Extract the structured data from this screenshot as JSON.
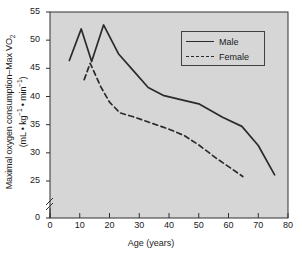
{
  "chart_data": {
    "type": "line",
    "title": "",
    "xlabel": "Age (years)",
    "ylabel_line1": "Maximal oxygen consumption–Max VO",
    "ylabel_line1_sub": "2",
    "ylabel_line2_prefix": "(mL • kg",
    "ylabel_line2_sup1": "−1",
    "ylabel_line2_mid": " • min",
    "ylabel_line2_sup2": "−1",
    "ylabel_line2_suffix": ")",
    "xlim": [
      0,
      80
    ],
    "ylim": [
      0,
      55
    ],
    "y_axis_break": true,
    "y_break_between": [
      0,
      25
    ],
    "xticks": [
      0,
      10,
      20,
      30,
      40,
      50,
      60,
      70,
      80
    ],
    "yticks": [
      0,
      25,
      30,
      35,
      40,
      45,
      50,
      55
    ],
    "grid": false,
    "plot_background": "#d6d6d6",
    "axis_color": "#303030",
    "line_color": "#2b2b2b",
    "legend_position": "upper right",
    "legend": [
      "Male",
      "Female"
    ],
    "series": [
      {
        "name": "Male",
        "style": "solid",
        "points": [
          [
            6.5,
            46.4
          ],
          [
            10.5,
            52.0
          ],
          [
            14.0,
            46.2
          ],
          [
            18.0,
            52.7
          ],
          [
            23.0,
            47.6
          ],
          [
            28.0,
            44.6
          ],
          [
            33.0,
            41.6
          ],
          [
            38.0,
            40.2
          ],
          [
            45.0,
            39.3
          ],
          [
            50.0,
            38.7
          ],
          [
            58.0,
            36.3
          ],
          [
            64.5,
            34.7
          ],
          [
            70.0,
            31.3
          ],
          [
            75.5,
            26.1
          ]
        ]
      },
      {
        "name": "Female",
        "style": "dashed",
        "points": [
          [
            11.5,
            43.0
          ],
          [
            13.5,
            45.9
          ],
          [
            17.0,
            41.8
          ],
          [
            20.0,
            39.0
          ],
          [
            23.5,
            37.1
          ],
          [
            28.0,
            36.4
          ],
          [
            34.0,
            35.3
          ],
          [
            40.0,
            34.2
          ],
          [
            45.0,
            33.1
          ],
          [
            50.0,
            31.4
          ],
          [
            56.0,
            29.0
          ],
          [
            61.0,
            27.2
          ],
          [
            64.8,
            25.8
          ]
        ]
      }
    ]
  }
}
